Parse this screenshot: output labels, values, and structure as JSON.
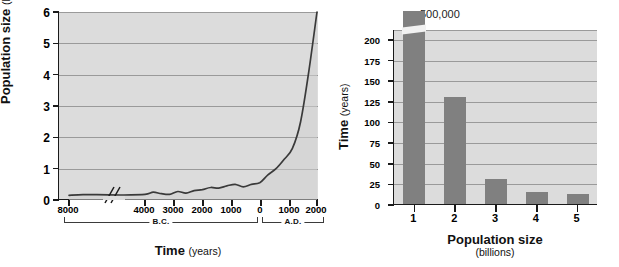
{
  "figure": {
    "panels": [
      "human-population-growth-line-chart",
      "time-to-add-billion-bar-chart"
    ]
  },
  "left_chart": {
    "ylabel_main": "Population size",
    "ylabel_unit": "(billions)",
    "xlabel_main": "Time",
    "xlabel_unit": "(years)",
    "era_bc": "B.C.",
    "era_ad": "A.D.",
    "yticks": [
      "0",
      "1",
      "2",
      "3",
      "4",
      "5",
      "6"
    ],
    "xticks": [
      "8000",
      "4000",
      "3000",
      "2000",
      "1000",
      "0",
      "1000",
      "2000"
    ],
    "axis_break_marker": "//"
  },
  "right_chart": {
    "ylabel_main": "Time",
    "ylabel_unit": "(years)",
    "xlabel_main": "Population size",
    "xlabel_unit": "(billions)",
    "yticks": [
      "0",
      "25",
      "50",
      "75",
      "100",
      "125",
      "150",
      "175",
      "200"
    ],
    "xticks": [
      "1",
      "2",
      "3",
      "4",
      "5"
    ],
    "bar1_annotation": "500,000"
  },
  "colors": {
    "plot_background": "#dcdcdc",
    "bar_fill": "#808080",
    "gridline": "#9a9a9a",
    "axis": "#1a1a1a",
    "curve": "#3a3a3a"
  },
  "chart_data": [
    {
      "type": "line",
      "title": "Human population growth over time",
      "xlabel": "Time (years)",
      "ylabel": "Population size (billions)",
      "ylim": [
        0,
        6
      ],
      "grid": true,
      "legend": "none",
      "x_tick_labels": [
        "8000",
        "4000",
        "3000",
        "2000",
        "1000",
        "0",
        "1000",
        "2000"
      ],
      "x_tick_eras": [
        "B.C.",
        "B.C.",
        "B.C.",
        "B.C.",
        "B.C.",
        "0",
        "A.D.",
        "A.D."
      ],
      "y_tick_labels": [
        "0",
        "1",
        "2",
        "3",
        "4",
        "5",
        "6"
      ],
      "axis_break_between": [
        "8000 B.C.",
        "4000 B.C."
      ],
      "series": [
        {
          "name": "World population",
          "x": [
            "8000 BC",
            "7000 BC",
            "6000 BC",
            "5000 BC",
            "4000 BC",
            "3500 BC",
            "3000 BC",
            "2500 BC",
            "2000 BC",
            "1500 BC",
            "1000 BC",
            "500 BC",
            "0",
            "500 AD",
            "1000 AD",
            "1200 AD",
            "1400 AD",
            "1500 AD",
            "1650 AD",
            "1750 AD",
            "1800 AD",
            "1850 AD",
            "1900 AD",
            "1950 AD",
            "1975 AD",
            "2000 AD"
          ],
          "values": [
            0.15,
            0.17,
            0.17,
            0.16,
            0.18,
            0.25,
            0.2,
            0.18,
            0.27,
            0.22,
            0.3,
            0.33,
            0.4,
            0.38,
            0.45,
            0.5,
            0.42,
            0.5,
            0.55,
            0.8,
            1.0,
            1.3,
            1.65,
            2.5,
            4.1,
            6.0
          ]
        }
      ]
    },
    {
      "type": "bar",
      "title": "Time required to add each billion people",
      "xlabel": "Population size (billions)",
      "ylabel": "Time (years)",
      "ylim": [
        0,
        212
      ],
      "grid": true,
      "legend": "none",
      "categories": [
        "1",
        "2",
        "3",
        "4",
        "5"
      ],
      "values": [
        500000,
        130,
        30,
        15,
        12
      ],
      "displayed_values": [
        212,
        130,
        30,
        15,
        12
      ],
      "annotations": [
        {
          "category": "1",
          "text": "500,000",
          "note": "bar truncated with axis break"
        }
      ],
      "y_tick_labels": [
        "0",
        "25",
        "50",
        "75",
        "100",
        "125",
        "150",
        "175",
        "200"
      ]
    }
  ]
}
